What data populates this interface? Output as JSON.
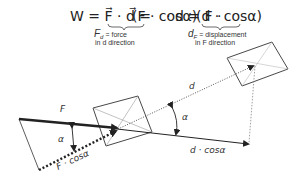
{
  "formula": {
    "main": "W = F · d = (F · cosα) · d = F · (d · cosα)",
    "part_W": "W = F⃗ · d⃗ =",
    "part_group1": "(F · cosα)",
    "part_mid": "· d = F ·",
    "part_group2": "(d · cosα)",
    "note1_line1": "F",
    "note1_sub": "d",
    "note1_rest": " = force",
    "note1_line2": "in d direction",
    "note2_line1": "d",
    "note2_sub": "F",
    "note2_rest": " = displacement",
    "note2_line2": "in F direction"
  },
  "labels": {
    "force": "F",
    "alpha_left": "α",
    "force_projection": "F · cosα",
    "displacement": "d",
    "alpha_right": "α",
    "displacement_projection": "d · cosα"
  },
  "colors": {
    "ink": "#222222",
    "light_ink": "#555555",
    "background": "#ffffff"
  }
}
